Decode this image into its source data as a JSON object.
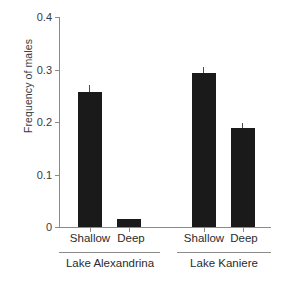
{
  "chart_data": {
    "type": "bar",
    "title": "",
    "xlabel": "",
    "ylabel": "Frequency of males",
    "ylim": [
      0,
      0.4
    ],
    "yticks": [
      "0",
      "0.1",
      "0.2",
      "0.3",
      "0.4"
    ],
    "ytick_values": [
      0,
      0.1,
      0.2,
      0.3,
      0.4
    ],
    "grid": false,
    "legend": "none",
    "categories": [
      "Shallow",
      "Deep",
      "Shallow",
      "Deep"
    ],
    "groups": [
      {
        "label": "Lake Alexandrina",
        "categories": [
          "Shallow",
          "Deep"
        ]
      },
      {
        "label": "Lake Kaniere",
        "categories": [
          "Shallow",
          "Deep"
        ]
      }
    ],
    "values": [
      0.258,
      0.016,
      0.293,
      0.188
    ],
    "errors": [
      0.012,
      0.0,
      0.012,
      0.01
    ],
    "bar_color": "#1a1a1a",
    "axis_color": "#8a8a8a",
    "bars": [
      {
        "group": "Lake Alexandrina",
        "category": "Shallow",
        "value": 0.258,
        "error": 0.012
      },
      {
        "group": "Lake Alexandrina",
        "category": "Deep",
        "value": 0.016,
        "error": 0.0
      },
      {
        "group": "Lake Kaniere",
        "category": "Shallow",
        "value": 0.293,
        "error": 0.012
      },
      {
        "group": "Lake Kaniere",
        "category": "Deep",
        "value": 0.188,
        "error": 0.01
      }
    ]
  },
  "axis": {
    "ylabel": "Frequency of males",
    "ticks": [
      {
        "text": "0.4",
        "value": 0.4
      },
      {
        "text": "0.3",
        "value": 0.3
      },
      {
        "text": "0.2",
        "value": 0.2
      },
      {
        "text": "0.1",
        "value": 0.1
      },
      {
        "text": "0",
        "value": 0
      }
    ]
  },
  "xlabels": [
    {
      "text": "Shallow"
    },
    {
      "text": "Deep"
    },
    {
      "text": "Shallow"
    },
    {
      "text": "Deep"
    }
  ],
  "grouplabels": [
    {
      "text": "Lake Alexandrina"
    },
    {
      "text": "Lake Kaniere"
    }
  ]
}
